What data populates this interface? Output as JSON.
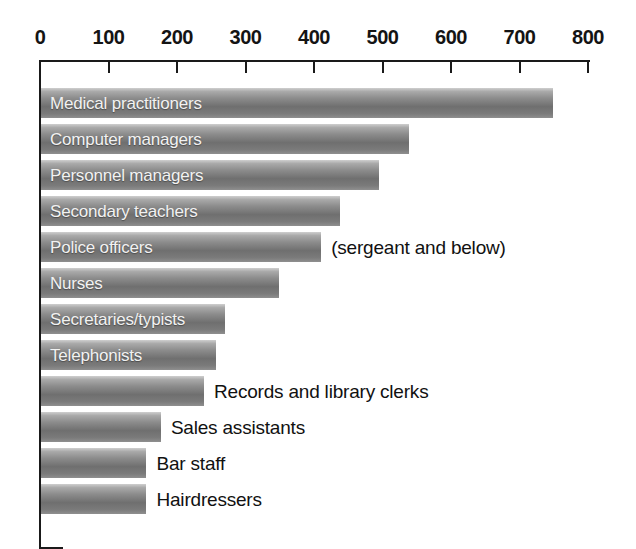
{
  "chart_data": {
    "type": "bar",
    "orientation": "horizontal",
    "title": "",
    "xlabel": "",
    "ylabel": "",
    "xlim": [
      0,
      800
    ],
    "grid": false,
    "legend": null,
    "tick_labels": [
      "0",
      "100",
      "200",
      "300",
      "400",
      "500",
      "600",
      "700",
      "800"
    ],
    "ticks": [
      0,
      100,
      200,
      300,
      400,
      500,
      600,
      700,
      800
    ],
    "categories": [
      "Medical practitioners",
      "Computer managers",
      "Personnel managers",
      "Secondary teachers",
      "Police officers",
      "Nurses",
      "Secretaries/typists",
      "Telephonists",
      "Records and library clerks",
      "Sales assistants",
      "Bar staff",
      "Hairdressers"
    ],
    "values": [
      748,
      537,
      493,
      437,
      409,
      348,
      269,
      256,
      238,
      175,
      154,
      154
    ],
    "annotations": [
      {
        "index": 4,
        "text": "(sergeant and below)"
      }
    ],
    "label_placement": [
      "inside",
      "inside",
      "inside",
      "inside",
      "inside",
      "inside",
      "inside",
      "inside",
      "outside",
      "outside",
      "outside",
      "outside"
    ]
  },
  "style": {
    "bar_light": "#cfcfcf",
    "bar_dark": "#6f6f6f",
    "axis_color": "#1a1a1a",
    "inside_label_color": "#f2f2f2",
    "outside_label_color": "#111111",
    "background": "#ffffff"
  }
}
